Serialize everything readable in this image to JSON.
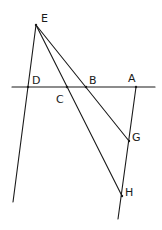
{
  "diagram": {
    "type": "geometry",
    "points": {
      "E": {
        "label": "E",
        "x": 36,
        "y": 25,
        "lx": 41,
        "ly": 22
      },
      "D": {
        "label": "D",
        "x": 28,
        "y": 87,
        "lx": 32,
        "ly": 84
      },
      "C": {
        "label": "C",
        "x": 67,
        "y": 87,
        "lx": 56,
        "ly": 103
      },
      "B": {
        "label": "B",
        "x": 86,
        "y": 87,
        "lx": 89,
        "ly": 84
      },
      "A": {
        "label": "A",
        "x": 136,
        "y": 87,
        "lx": 128,
        "ly": 82
      },
      "G": {
        "label": "G",
        "x": 129,
        "y": 141,
        "lx": 132,
        "ly": 141
      },
      "H": {
        "label": "H",
        "x": 122,
        "y": 196,
        "lx": 125,
        "ly": 196
      }
    },
    "lines": [
      {
        "name": "horizontal-line",
        "x1": 12,
        "y1": 87,
        "x2": 155,
        "y2": 87
      },
      {
        "name": "line-E-D",
        "x1": 36,
        "y1": 25,
        "x2": 13,
        "y2": 202
      },
      {
        "name": "line-E-C-H",
        "x1": 36,
        "y1": 25,
        "x2": 122,
        "y2": 196
      },
      {
        "name": "line-E-B-G",
        "x1": 36,
        "y1": 25,
        "x2": 129,
        "y2": 141
      },
      {
        "name": "line-A-G-H",
        "x1": 136,
        "y1": 87,
        "x2": 118,
        "y2": 219
      }
    ]
  }
}
